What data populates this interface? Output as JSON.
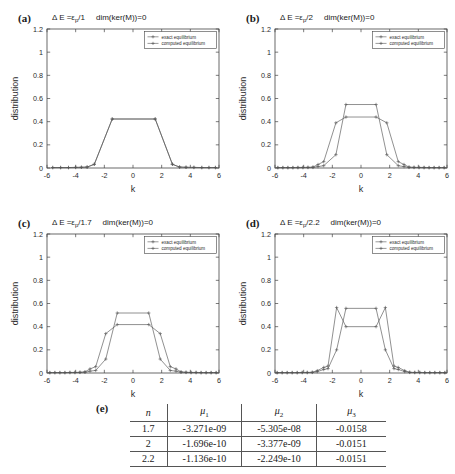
{
  "figure": {
    "panels": [
      {
        "id": "a",
        "label": "(a)",
        "title_prefix": "Δ E =ε",
        "title_sub": "p",
        "title_denom": "/1",
        "title_kernel": "dim(ker(M))=0"
      },
      {
        "id": "b",
        "label": "(b)",
        "title_prefix": "Δ E =ε",
        "title_sub": "p",
        "title_denom": "/2",
        "title_kernel": "dim(ker(M))=0"
      },
      {
        "id": "c",
        "label": "(c)",
        "title_prefix": "Δ E =ε",
        "title_sub": "p",
        "title_denom": "/1.7",
        "title_kernel": "dim(ker(M))=0"
      },
      {
        "id": "d",
        "label": "(d)",
        "title_prefix": "Δ E =ε",
        "title_sub": "p",
        "title_denom": "/2.2",
        "title_kernel": "dim(ker(M))=0"
      }
    ],
    "axes": {
      "xlabel": "k",
      "ylabel": "distribution",
      "xticks": [
        "-6",
        "-4",
        "-2",
        "0",
        "2",
        "4",
        "6"
      ],
      "xtick_values": [
        -6,
        -4,
        -2,
        0,
        2,
        4,
        6
      ],
      "yticks": [
        "0",
        "0.2",
        "0.4",
        "0.6",
        "0.8",
        "1",
        "1.2"
      ],
      "ytick_values": [
        0,
        0.2,
        0.4,
        0.6,
        0.8,
        1,
        1.2
      ],
      "xlim": [
        -6,
        6
      ],
      "ylim": [
        0,
        1.2
      ]
    },
    "legend": {
      "entries": [
        "exact equilibrium",
        "computed equilibrium"
      ],
      "position": "top-right"
    },
    "colors": {
      "line": "#555555",
      "axis": "#444444",
      "text": "#1a1a1a",
      "background": "#ffffff"
    }
  },
  "chart_data": [
    {
      "type": "line",
      "panel": "a",
      "title": "Δ E = ε_p/1    dim(ker(M))=0",
      "xlabel": "k",
      "ylabel": "distribution",
      "xlim": [
        -6,
        6
      ],
      "ylim": [
        0,
        1.2
      ],
      "grid": false,
      "legend": [
        "exact equilibrium",
        "computed equilibrium"
      ],
      "series": [
        {
          "name": "exact equilibrium",
          "x": [
            -5.6,
            -5.05,
            -4.5,
            -4.0,
            -3.6,
            -3.2,
            -2.7,
            -1.45,
            1.55,
            2.75,
            3.25,
            3.7,
            4.25,
            4.8,
            5.3,
            5.75
          ],
          "y": [
            0.004,
            0.004,
            0.004,
            0.005,
            0.006,
            0.008,
            0.032,
            0.423,
            0.423,
            0.032,
            0.008,
            0.006,
            0.005,
            0.004,
            0.004,
            0.004
          ]
        },
        {
          "name": "computed equilibrium",
          "x": [
            -5.6,
            -5.05,
            -4.5,
            -4.0,
            -3.6,
            -3.2,
            -2.7,
            -1.45,
            1.55,
            2.75,
            3.25,
            3.7,
            4.25,
            4.8,
            5.3,
            5.75
          ],
          "y": [
            0.004,
            0.004,
            0.004,
            0.005,
            0.006,
            0.008,
            0.032,
            0.423,
            0.423,
            0.032,
            0.008,
            0.006,
            0.005,
            0.004,
            0.004,
            0.004
          ]
        }
      ]
    },
    {
      "type": "line",
      "panel": "b",
      "title": "Δ E = ε_p/2    dim(ker(M))=0",
      "xlabel": "k",
      "ylabel": "distribution",
      "xlim": [
        -6,
        6
      ],
      "ylim": [
        0,
        1.2
      ],
      "grid": false,
      "legend": [
        "exact equilibrium",
        "computed equilibrium"
      ],
      "series": [
        {
          "name": "exact equilibrium",
          "x": [
            -5.8,
            -5.45,
            -5.1,
            -4.75,
            -4.4,
            -4.05,
            -3.7,
            -3.35,
            -3.0,
            -2.6,
            -1.75,
            -1.05,
            1.05,
            1.8,
            2.6,
            3.0,
            3.35,
            3.7,
            4.05,
            4.4,
            4.75,
            5.1,
            5.45,
            5.8
          ],
          "y": [
            0.004,
            0.004,
            0.004,
            0.004,
            0.005,
            0.005,
            0.006,
            0.008,
            0.03,
            0.055,
            0.39,
            0.44,
            0.44,
            0.39,
            0.055,
            0.03,
            0.008,
            0.006,
            0.005,
            0.005,
            0.004,
            0.004,
            0.004,
            0.004
          ]
        },
        {
          "name": "computed equilibrium",
          "x": [
            -5.8,
            -5.45,
            -5.1,
            -4.75,
            -4.4,
            -4.05,
            -3.7,
            -3.35,
            -3.0,
            -2.6,
            -1.75,
            -1.05,
            1.05,
            1.8,
            2.6,
            3.0,
            3.35,
            3.7,
            4.05,
            4.4,
            4.75,
            5.1,
            5.45,
            5.8
          ],
          "y": [
            0.003,
            0.003,
            0.003,
            0.003,
            0.003,
            0.004,
            0.004,
            0.005,
            0.012,
            0.02,
            0.115,
            0.548,
            0.548,
            0.115,
            0.02,
            0.012,
            0.005,
            0.004,
            0.004,
            0.003,
            0.003,
            0.003,
            0.003,
            0.003
          ]
        }
      ]
    },
    {
      "type": "line",
      "panel": "c",
      "title": "Δ E = ε_p/1.7    dim(ker(M))=0",
      "xlabel": "k",
      "ylabel": "distribution",
      "xlim": [
        -6,
        6
      ],
      "ylim": [
        0,
        1.2
      ],
      "grid": false,
      "legend": [
        "exact equilibrium",
        "computed equilibrium"
      ],
      "series": [
        {
          "name": "exact equilibrium",
          "x": [
            -5.8,
            -5.45,
            -5.1,
            -4.75,
            -4.4,
            -4.05,
            -3.7,
            -3.35,
            -3.0,
            -2.6,
            -1.9,
            -1.1,
            1.1,
            1.9,
            2.6,
            3.0,
            3.35,
            3.7,
            4.05,
            4.4,
            4.75,
            5.1,
            5.45,
            5.8
          ],
          "y": [
            0.004,
            0.004,
            0.004,
            0.004,
            0.005,
            0.005,
            0.006,
            0.01,
            0.035,
            0.055,
            0.34,
            0.418,
            0.418,
            0.34,
            0.055,
            0.035,
            0.01,
            0.006,
            0.005,
            0.005,
            0.004,
            0.004,
            0.004,
            0.004
          ]
        },
        {
          "name": "computed equilibrium",
          "x": [
            -5.8,
            -5.45,
            -5.1,
            -4.75,
            -4.4,
            -4.05,
            -3.7,
            -3.35,
            -3.0,
            -2.6,
            -1.9,
            -1.1,
            1.1,
            1.9,
            2.6,
            3.0,
            3.35,
            3.7,
            4.05,
            4.4,
            4.75,
            5.1,
            5.45,
            5.8
          ],
          "y": [
            0.003,
            0.003,
            0.003,
            0.003,
            0.004,
            0.004,
            0.005,
            0.006,
            0.016,
            0.022,
            0.12,
            0.518,
            0.518,
            0.12,
            0.022,
            0.016,
            0.006,
            0.005,
            0.004,
            0.004,
            0.003,
            0.003,
            0.003,
            0.003
          ]
        }
      ]
    },
    {
      "type": "line",
      "panel": "d",
      "title": "Δ E = ε_p/2.2    dim(ker(M))=0",
      "xlabel": "k",
      "ylabel": "distribution",
      "xlim": [
        -6,
        6
      ],
      "ylim": [
        0,
        1.2
      ],
      "grid": false,
      "legend": [
        "exact equilibrium",
        "computed equilibrium"
      ],
      "series": [
        {
          "name": "exact equilibrium",
          "x": [
            -5.85,
            -5.5,
            -5.15,
            -4.8,
            -4.45,
            -4.1,
            -3.75,
            -3.4,
            -3.05,
            -2.6,
            -2.3,
            -1.7,
            -1.05,
            1.05,
            1.7,
            2.3,
            2.6,
            3.05,
            3.4,
            3.75,
            4.1,
            4.45,
            4.8,
            5.15,
            5.5,
            5.85
          ],
          "y": [
            0.004,
            0.004,
            0.004,
            0.004,
            0.004,
            0.005,
            0.005,
            0.006,
            0.02,
            0.048,
            0.06,
            0.565,
            0.4,
            0.4,
            0.565,
            0.06,
            0.048,
            0.02,
            0.006,
            0.005,
            0.005,
            0.004,
            0.004,
            0.004,
            0.004,
            0.004
          ]
        },
        {
          "name": "computed equilibrium",
          "x": [
            -5.85,
            -5.5,
            -5.15,
            -4.8,
            -4.45,
            -4.1,
            -3.75,
            -3.4,
            -3.05,
            -2.6,
            -2.3,
            -1.7,
            -1.05,
            1.05,
            1.7,
            2.3,
            2.6,
            3.05,
            3.4,
            3.75,
            4.1,
            4.45,
            4.8,
            5.15,
            5.5,
            5.85
          ],
          "y": [
            0.003,
            0.003,
            0.003,
            0.003,
            0.003,
            0.004,
            0.004,
            0.005,
            0.012,
            0.03,
            0.038,
            0.2,
            0.558,
            0.558,
            0.2,
            0.038,
            0.03,
            0.012,
            0.005,
            0.004,
            0.004,
            0.003,
            0.003,
            0.003,
            0.003,
            0.003
          ]
        }
      ]
    }
  ],
  "table": {
    "label": "(e)",
    "columns": [
      "n",
      "μ1",
      "μ2",
      "μ3"
    ],
    "rows": [
      {
        "n": "1.7",
        "mu1": "-3.271e-09",
        "mu2": "-5.305e-08",
        "mu3": "-0.0158"
      },
      {
        "n": "2",
        "mu1": "-1.696e-10",
        "mu2": "-3.377e-09",
        "mu3": "-0.0151"
      },
      {
        "n": "2.2",
        "mu1": "-1.136e-10",
        "mu2": "-2.249e-10",
        "mu3": "-0.0151"
      }
    ]
  }
}
